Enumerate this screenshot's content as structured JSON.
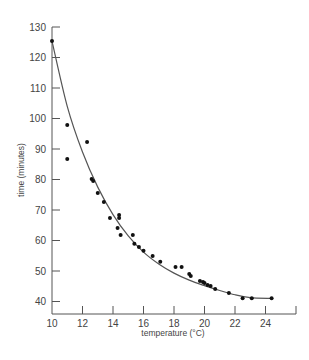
{
  "chart_data": {
    "type": "scatter",
    "title": "",
    "xlabel": "temperature (°C)",
    "ylabel": "time (minutes)",
    "xlim": [
      10,
      26
    ],
    "ylim": [
      36,
      130
    ],
    "grid": false,
    "legend": null,
    "x_ticks": [
      10,
      12,
      14,
      16,
      18,
      20,
      22,
      24
    ],
    "y_ticks": [
      40,
      50,
      60,
      70,
      80,
      90,
      100,
      110,
      120,
      130
    ],
    "series": [
      {
        "name": "observations",
        "marker": "filled-circle",
        "points": [
          [
            10.0,
            125.4
          ],
          [
            11.0,
            97.9
          ],
          [
            12.3,
            92.3
          ],
          [
            11.0,
            86.7
          ],
          [
            12.6,
            80.2
          ],
          [
            12.7,
            79.5
          ],
          [
            13.0,
            75.6
          ],
          [
            13.4,
            72.6
          ],
          [
            13.8,
            67.4
          ],
          [
            14.4,
            68.4
          ],
          [
            14.4,
            67.4
          ],
          [
            14.3,
            64.1
          ],
          [
            14.5,
            61.8
          ],
          [
            15.3,
            61.8
          ],
          [
            15.4,
            58.9
          ],
          [
            15.7,
            57.9
          ],
          [
            16.0,
            56.6
          ],
          [
            16.6,
            54.9
          ],
          [
            17.1,
            53.0
          ],
          [
            18.1,
            51.3
          ],
          [
            18.5,
            51.3
          ],
          [
            19.0,
            49.0
          ],
          [
            19.1,
            48.4
          ],
          [
            19.7,
            46.7
          ],
          [
            19.9,
            46.4
          ],
          [
            20.0,
            46.1
          ],
          [
            20.2,
            45.4
          ],
          [
            20.4,
            45.1
          ],
          [
            20.7,
            44.1
          ],
          [
            21.6,
            42.8
          ],
          [
            22.5,
            41.1
          ],
          [
            23.1,
            41.1
          ],
          [
            24.4,
            41.1
          ]
        ]
      },
      {
        "name": "fitted curve",
        "type": "line",
        "points": [
          [
            10.0,
            125.4
          ],
          [
            11.0,
            104.0
          ],
          [
            12.0,
            89.0
          ],
          [
            13.0,
            77.5
          ],
          [
            14.0,
            68.5
          ],
          [
            15.0,
            61.5
          ],
          [
            16.0,
            56.2
          ],
          [
            17.0,
            52.3
          ],
          [
            18.0,
            49.3
          ],
          [
            19.0,
            47.0
          ],
          [
            20.0,
            45.2
          ],
          [
            21.0,
            43.6
          ],
          [
            22.0,
            42.2
          ],
          [
            23.0,
            41.3
          ],
          [
            24.4,
            41.0
          ]
        ]
      }
    ]
  }
}
